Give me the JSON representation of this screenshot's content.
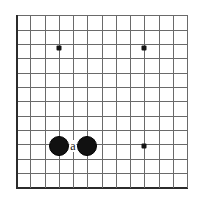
{
  "diagram": {
    "kind": "go-board-diagram",
    "colors": {
      "background": "#ffffff",
      "grid_line": "#6a6a6a",
      "board_edge": "#2b2b2b",
      "star_point": "#151515",
      "black_stone": "#111111",
      "white_stone": "#fdfdfd",
      "label_text": "#111111"
    },
    "geometry": {
      "width": 208,
      "height": 205,
      "cell_size": 14.3,
      "origin_x": 16,
      "origin_y": 15,
      "columns": 13,
      "rows": 13
    },
    "edges": {
      "left": true,
      "bottom": true,
      "top": false,
      "right": false
    },
    "grid": {
      "vertical_lines": [
        16,
        30,
        45,
        59,
        73,
        87,
        102,
        116,
        130,
        144,
        159,
        173,
        187
      ],
      "horizontal_lines": [
        15,
        30,
        44,
        58,
        73,
        87,
        101,
        116,
        130,
        144,
        159,
        173,
        187
      ]
    },
    "star_points": [
      {
        "name": "star-point-upper-left",
        "x": 59,
        "y": 48
      },
      {
        "name": "star-point-upper-right",
        "x": 144,
        "y": 48
      },
      {
        "name": "star-point-lower-right",
        "x": 144,
        "y": 146
      }
    ],
    "stones": [
      {
        "name": "black-stone-left",
        "color": "black",
        "x": 59,
        "y": 146,
        "radius": 9
      },
      {
        "name": "black-stone-right",
        "color": "black",
        "x": 87,
        "y": 146,
        "radius": 9
      }
    ],
    "labels": [
      {
        "name": "point-label-a",
        "text": "a",
        "x": 73,
        "y": 146
      }
    ]
  }
}
